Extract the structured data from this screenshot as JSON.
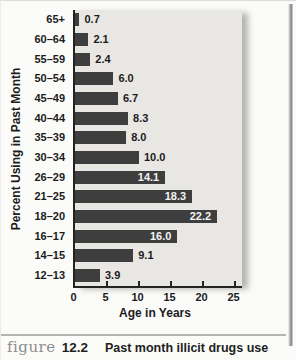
{
  "chart_data": {
    "type": "bar",
    "orientation": "horizontal",
    "categories": [
      "65+",
      "60–64",
      "55–59",
      "50–54",
      "45–49",
      "40–44",
      "35–39",
      "30–34",
      "26–29",
      "21–25",
      "18–20",
      "16–17",
      "14–15",
      "12–13"
    ],
    "values": [
      0.7,
      2.1,
      2.4,
      6.0,
      6.7,
      8.3,
      8.0,
      10.0,
      14.1,
      18.3,
      22.2,
      16.0,
      9.1,
      3.9
    ],
    "value_labels": [
      "0.7",
      "2.1",
      "2.4",
      "6.0",
      "6.7",
      "8.3",
      "8.0",
      "10.0",
      "14.1",
      "18.3",
      "22.2",
      "16.0",
      "9.1",
      "3.9"
    ],
    "xlabel": "Age in Years",
    "ylabel": "Percent Using in Past Month",
    "xlim": [
      0,
      25
    ],
    "xticks": [
      0,
      5,
      10,
      15,
      20,
      25
    ],
    "grid": "off",
    "legend": "none",
    "bar_color": "#3e3e3e",
    "panel_color": "#e9e7e3",
    "inside_label_threshold": 14
  },
  "caption": {
    "figure_word": "figure",
    "figure_number": "12.2",
    "text": "Past month illicit drugs use"
  }
}
